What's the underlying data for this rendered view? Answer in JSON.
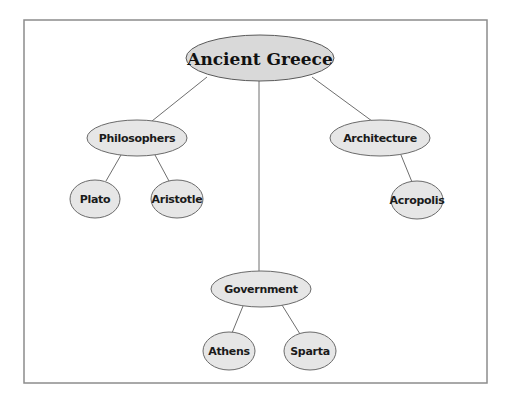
{
  "diagram": {
    "type": "concept-map",
    "root": {
      "id": "ancient-greece",
      "label": "Ancient Greece",
      "cx": 260,
      "cy": 58,
      "rx": 74,
      "ry": 23
    },
    "nodes": [
      {
        "id": "philosophers",
        "label": "Philosophers",
        "parent": "ancient-greece",
        "cx": 137,
        "cy": 138,
        "rx": 50,
        "ry": 18
      },
      {
        "id": "architecture",
        "label": "Architecture",
        "parent": "ancient-greece",
        "cx": 380,
        "cy": 138,
        "rx": 50,
        "ry": 18
      },
      {
        "id": "government",
        "label": "Government",
        "parent": "ancient-greece",
        "cx": 261,
        "cy": 289,
        "rx": 50,
        "ry": 18
      },
      {
        "id": "plato",
        "label": "Plato",
        "parent": "philosophers",
        "cx": 95,
        "cy": 199,
        "rx": 25,
        "ry": 19
      },
      {
        "id": "aristotle",
        "label": "Aristotle",
        "parent": "philosophers",
        "cx": 177,
        "cy": 199,
        "rx": 26,
        "ry": 19
      },
      {
        "id": "acropolis",
        "label": "Acropolis",
        "parent": "architecture",
        "cx": 417,
        "cy": 200,
        "rx": 26,
        "ry": 19
      },
      {
        "id": "athens",
        "label": "Athens",
        "parent": "government",
        "cx": 229,
        "cy": 351,
        "rx": 26,
        "ry": 19
      },
      {
        "id": "sparta",
        "label": "Sparta",
        "parent": "government",
        "cx": 310,
        "cy": 351,
        "rx": 26,
        "ry": 19
      }
    ],
    "edges": [
      {
        "from": "ancient-greece",
        "to": "philosophers",
        "x1": 207,
        "y1": 77,
        "x2": 152,
        "y2": 121
      },
      {
        "from": "ancient-greece",
        "to": "government",
        "x1": 259,
        "y1": 81,
        "x2": 259,
        "y2": 271
      },
      {
        "from": "ancient-greece",
        "to": "architecture",
        "x1": 312,
        "y1": 77,
        "x2": 372,
        "y2": 121
      },
      {
        "from": "philosophers",
        "to": "plato",
        "x1": 121,
        "y1": 155,
        "x2": 106,
        "y2": 181
      },
      {
        "from": "philosophers",
        "to": "aristotle",
        "x1": 155,
        "y1": 155,
        "x2": 169,
        "y2": 181
      },
      {
        "from": "architecture",
        "to": "acropolis",
        "x1": 401,
        "y1": 155,
        "x2": 412,
        "y2": 182
      },
      {
        "from": "government",
        "to": "athens",
        "x1": 243,
        "y1": 306,
        "x2": 232,
        "y2": 333
      },
      {
        "from": "government",
        "to": "sparta",
        "x1": 282,
        "y1": 305,
        "x2": 300,
        "y2": 334
      }
    ],
    "frame": {
      "x": 24,
      "y": 20,
      "width": 463,
      "height": 363
    }
  },
  "colors": {
    "node_fill": "#e6e6e6",
    "root_fill": "#d9d9d9",
    "stroke": "#6a6a6a",
    "frame_stroke": "#8c8c8c",
    "text": "#1a1a1a"
  }
}
